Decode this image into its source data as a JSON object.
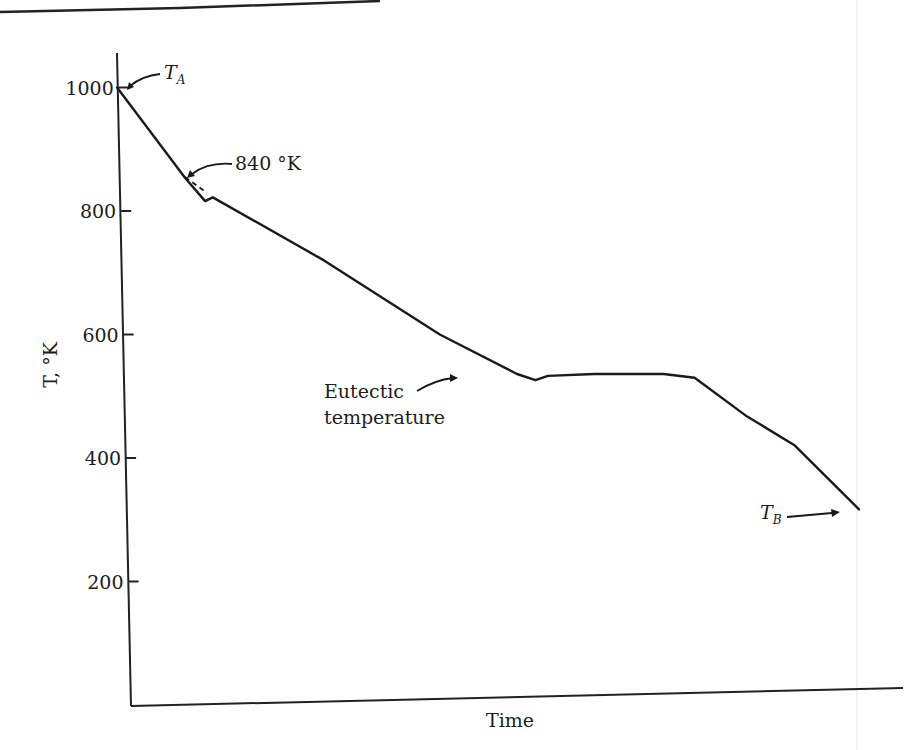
{
  "chart_data": {
    "type": "line",
    "title": "",
    "xlabel": "Time",
    "ylabel": "T, °K",
    "yticks": [
      200,
      400,
      600,
      800,
      1000
    ],
    "ytick_labels": [
      "200",
      "400",
      "600",
      "800",
      "1000"
    ],
    "ylim": [
      0,
      1060
    ],
    "xlim": [
      0,
      100
    ],
    "grid": false,
    "legend": null,
    "series": [
      {
        "name": "Cooling curve",
        "x": [
          -1.8,
          7.0,
          9.6,
          10.6,
          25,
          40,
          50,
          52.4,
          54,
          60,
          66,
          69,
          73,
          79.6,
          86,
          94.3
        ],
        "y": [
          1000,
          854,
          816,
          822,
          720,
          600,
          536,
          526,
          533,
          536,
          536,
          536,
          530,
          469,
          420,
          317
        ]
      }
    ],
    "dashed_extrapolation": {
      "x": [
        7.0,
        9.8
      ],
      "y": [
        854,
        825
      ]
    },
    "annotations": [
      {
        "label": "T",
        "subscript": "A",
        "text": "T_A",
        "point": {
          "x": -1.8,
          "y": 1000
        }
      },
      {
        "label": "840 °K",
        "point": {
          "x": 7.0,
          "y": 854
        }
      },
      {
        "label": "Eutectic temperature",
        "lines": [
          "Eutectic",
          "temperature"
        ],
        "point": {
          "x": 52.4,
          "y": 526
        }
      },
      {
        "label": "T",
        "subscript": "B",
        "text": "T_B",
        "point": {
          "x": 94.3,
          "y": 317
        }
      }
    ]
  }
}
